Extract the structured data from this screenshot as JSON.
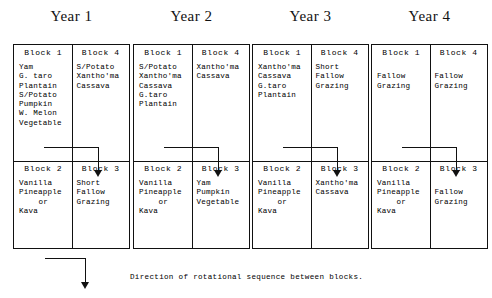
{
  "figure": {
    "caption": "Direction of rotational sequence between blocks.",
    "block_labels": {
      "block1": "Block 1",
      "block2": "Block 2",
      "block3": "Block 3",
      "block4": "Block 4"
    }
  },
  "years": [
    {
      "title": "Year 1",
      "block1": [
        "Yam",
        "G. taro",
        "Plantain",
        "S/Potato",
        "Pumpkin",
        "W. Melon",
        "Vegetable"
      ],
      "block4": [
        "S/Potato",
        "Xantho'ma",
        "Cassava"
      ],
      "block2": [
        "Vanilla",
        "Pineapple",
        "or",
        "Kava"
      ],
      "block3": [
        "Short",
        "Fallow",
        "Grazing"
      ]
    },
    {
      "title": "Year 2",
      "block1": [
        "S/Potato",
        "Xantho'ma",
        "Cassava",
        "G.taro",
        "Plantain"
      ],
      "block4": [
        "Xantho'ma",
        "Cassava"
      ],
      "block2": [
        "Vanilla",
        "Pineapple",
        "or",
        "Kava"
      ],
      "block3": [
        "Yam",
        "Pumpkin",
        "Vegetable"
      ]
    },
    {
      "title": "Year 3",
      "block1": [
        "Xantho'ma",
        "Cassava",
        "G.taro",
        "Plantain"
      ],
      "block4": [
        "Short",
        "Fallow",
        "Grazing"
      ],
      "block2": [
        "Vanilla",
        "Pineapple",
        "or",
        "Kava"
      ],
      "block3": [
        "Xantho'ma",
        "Cassava"
      ]
    },
    {
      "title": "Year 4",
      "block1": [
        "",
        "Fallow",
        "Grazing"
      ],
      "block4": [
        "",
        "Fallow",
        "Grazing"
      ],
      "block2": [
        "Vanilla",
        "Pineapple",
        "or",
        "Kava"
      ],
      "block3": [
        "",
        "Fallow",
        "Grazing"
      ]
    }
  ],
  "chart_data": {
    "type": "table",
    "categories": [
      "Year 1",
      "Year 2",
      "Year 3",
      "Year 4"
    ],
    "row_labels": [
      "Block 1",
      "Block 4",
      "Block 2",
      "Block 3"
    ],
    "cells": [
      [
        "Yam / G. taro / Plantain / S/Potato / Pumpkin / W. Melon / Vegetable",
        "S/Potato / Xantho'ma / Cassava",
        "Vanilla / Pineapple or Kava",
        "Short Fallow Grazing"
      ],
      [
        "S/Potato / Xantho'ma / Cassava / G.taro / Plantain",
        "Xantho'ma / Cassava",
        "Vanilla / Pineapple or Kava",
        "Yam / Pumpkin / Vegetable"
      ],
      [
        "Xantho'ma / Cassava / G.taro / Plantain",
        "Short Fallow Grazing",
        "Vanilla / Pineapple or Kava",
        "Xantho'ma / Cassava"
      ],
      [
        "Fallow Grazing",
        "Fallow Grazing",
        "Vanilla / Pineapple or Kava",
        "Fallow Grazing"
      ]
    ],
    "annotation": "Direction of rotational sequence between blocks."
  }
}
